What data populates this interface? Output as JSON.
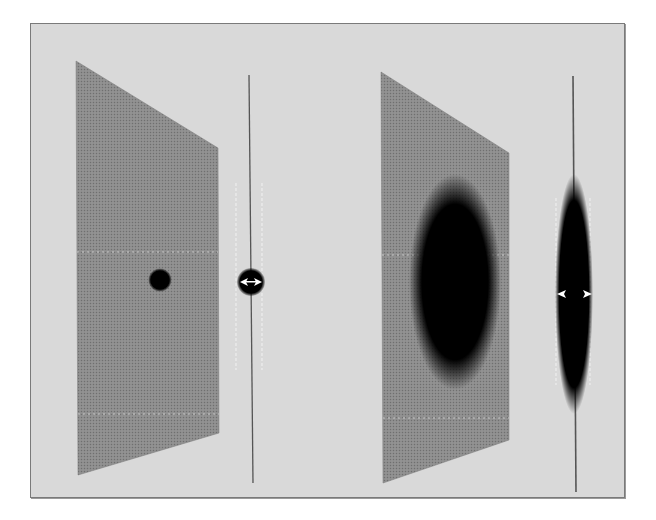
{
  "figure": {
    "background_color": "#d9d9d9",
    "frame_border_color": "#7a7a7a",
    "panels": [
      {
        "id": "left",
        "sheet": {
          "fill": "#8a8a8a",
          "points": "76,61 218,148 219,433 78,475",
          "dashed_lines_y": [
            252,
            414
          ],
          "feature": {
            "shape": "circle",
            "cx": 160,
            "cy": 280,
            "r": 11,
            "color": "#000000"
          }
        },
        "side_view": {
          "line_x_top": 249,
          "line_x_bottom": 253,
          "y_top": 75,
          "y_bottom": 483,
          "guide_lines_x": [
            236,
            262
          ],
          "guide_y": [
            183,
            370
          ],
          "bulge": {
            "cx": 251,
            "cy": 282,
            "rx": 14,
            "ry": 14
          },
          "arrows_direction": "inward"
        }
      },
      {
        "id": "right",
        "sheet": {
          "fill": "#8a8a8a",
          "points": "381,72 509,153 509,440 383,483",
          "dashed_lines_y": [
            255,
            418
          ],
          "feature": {
            "shape": "ellipse",
            "cx": 455,
            "cy": 282,
            "rx": 44,
            "ry": 103,
            "color": "#000000"
          }
        },
        "side_view": {
          "line_x_top": 573,
          "line_x_bottom": 576,
          "y_top": 76,
          "y_bottom": 492,
          "guide_lines_x": [
            556,
            590
          ],
          "guide_y": [
            198,
            385
          ],
          "bulge": {
            "cx": 574,
            "cy": 294,
            "rx": 18,
            "ry": 116
          },
          "arrows_direction": "outward"
        }
      }
    ]
  }
}
